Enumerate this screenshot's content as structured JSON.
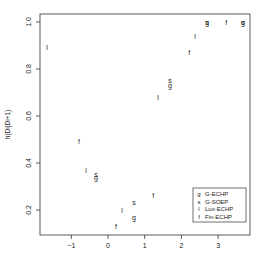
{
  "chart_data": {
    "type": "scatter",
    "title": "",
    "xlabel": "",
    "ylabel": "h(Di|Di+1)",
    "xlim": [
      -1.85,
      3.85
    ],
    "ylim": [
      0.1,
      1.04
    ],
    "x_ticks": [
      -1,
      0,
      1,
      2,
      3
    ],
    "x_tick_labels": [
      "−1",
      "0",
      "1",
      "2",
      "3"
    ],
    "y_ticks": [
      0.2,
      0.4,
      0.6,
      0.8,
      1.0
    ],
    "y_tick_labels": [
      "0.2",
      "0.4",
      "0.6",
      "0.8",
      "1.0"
    ],
    "grid": false,
    "legend_position": "bottom-right",
    "series": [
      {
        "name": "G-ECHP",
        "symbol": "g",
        "points": [
          {
            "x": -0.33,
            "y": 0.34
          },
          {
            "x": 0.71,
            "y": 0.17
          },
          {
            "x": 1.69,
            "y": 0.73
          },
          {
            "x": 2.7,
            "y": 1.0
          },
          {
            "x": 3.68,
            "y": 1.0
          }
        ]
      },
      {
        "name": "G-SOEP",
        "symbol": "s",
        "points": [
          {
            "x": -0.33,
            "y": 0.35
          },
          {
            "x": 0.71,
            "y": 0.23
          },
          {
            "x": 1.69,
            "y": 0.75
          },
          {
            "x": 2.7,
            "y": 1.0
          },
          {
            "x": 3.68,
            "y": 1.0
          }
        ]
      },
      {
        "name": "Lux-ECHP",
        "symbol": "l",
        "points": [
          {
            "x": -1.66,
            "y": 0.89
          },
          {
            "x": -0.6,
            "y": 0.37
          },
          {
            "x": 0.38,
            "y": 0.2
          },
          {
            "x": 1.36,
            "y": 0.68
          },
          {
            "x": 2.37,
            "y": 0.94
          }
        ]
      },
      {
        "name": "Fin-ECHP",
        "symbol": "f",
        "points": [
          {
            "x": -0.79,
            "y": 0.49
          },
          {
            "x": 0.22,
            "y": 0.13
          },
          {
            "x": 1.23,
            "y": 0.26
          },
          {
            "x": 2.21,
            "y": 0.87
          },
          {
            "x": 3.22,
            "y": 1.0
          }
        ]
      }
    ]
  },
  "legend": {
    "items": [
      {
        "symbol": "g",
        "label": "G-ECHP"
      },
      {
        "symbol": "s",
        "label": "G-SOEP"
      },
      {
        "symbol": "l",
        "label": "Lux-ECHP"
      },
      {
        "symbol": "f",
        "label": "Fin-ECHP"
      }
    ]
  },
  "colors": {
    "ink": "#222222",
    "background": "#ffffff"
  }
}
